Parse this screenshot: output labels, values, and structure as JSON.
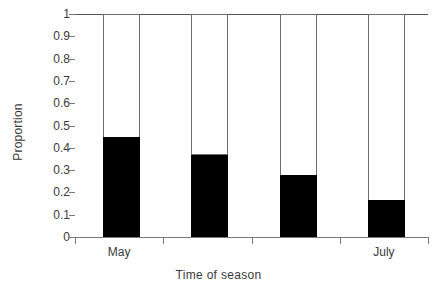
{
  "chart_data": {
    "type": "bar",
    "title": "",
    "subtitle": "",
    "xlabel": "Time of season",
    "ylabel": "Proportion",
    "ylim": [
      0,
      1
    ],
    "yticks": [
      "0",
      "0.1",
      "0.2",
      "0.3",
      "0.4",
      "0.5",
      "0.6",
      "0.7",
      "0.8",
      "0.9",
      "1"
    ],
    "ytick_values": [
      0,
      0.1,
      0.2,
      0.3,
      0.4,
      0.5,
      0.6,
      0.7,
      0.8,
      0.9,
      1
    ],
    "grid": false,
    "legend": "none",
    "stacked": true,
    "categories": [
      "May",
      "",
      "",
      "July"
    ],
    "xtick_labels_visible": [
      "May",
      "July"
    ],
    "series": [
      {
        "name": "lower-proportion",
        "color": "#000000",
        "values": [
          0.45,
          0.37,
          0.28,
          0.165
        ]
      },
      {
        "name": "upper-proportion",
        "color": "#ffffff",
        "values": [
          0.55,
          0.63,
          0.72,
          0.835
        ]
      }
    ],
    "bars": [
      {
        "index": 0,
        "label": "May",
        "black": 0.45,
        "white": 0.55
      },
      {
        "index": 1,
        "label": "",
        "black": 0.37,
        "white": 0.63
      },
      {
        "index": 2,
        "label": "",
        "black": 0.28,
        "white": 0.72
      },
      {
        "index": 3,
        "label": "July",
        "black": 0.165,
        "white": 0.835
      }
    ],
    "colors": {
      "bar_fill_lower": "#000000",
      "bar_fill_upper": "#ffffff",
      "bar_outline": "#6d6d6d",
      "axis": "#7a7a7a",
      "text": "#3a3a3a",
      "background": "#ffffff"
    }
  }
}
